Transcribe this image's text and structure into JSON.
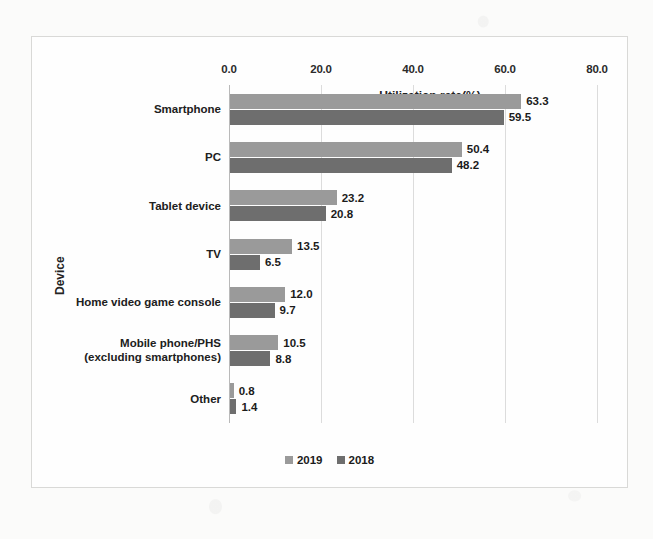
{
  "chart_data": {
    "type": "bar",
    "orientation": "horizontal",
    "title": "",
    "xlabel": "Utilization rate(%)",
    "ylabel": "Device",
    "xlim": [
      0.0,
      80.0
    ],
    "xticks": [
      "0.0",
      "20.0",
      "40.0",
      "60.0",
      "80.0"
    ],
    "xtick_values": [
      0,
      20,
      40,
      60,
      80
    ],
    "grid": true,
    "legend_position": "bottom",
    "categories": [
      "Smartphone",
      "PC",
      "Tablet device",
      "TV",
      "Home video game console",
      "Mobile phone/PHS\n(excluding smartphones)",
      "Other"
    ],
    "series": [
      {
        "name": "2019",
        "color": "#9a9a9a",
        "values": [
          63.3,
          50.4,
          23.2,
          13.5,
          12.0,
          10.5,
          0.8
        ],
        "labels": [
          "63.3",
          "50.4",
          "23.2",
          "13.5",
          "12.0",
          "10.5",
          "0.8"
        ]
      },
      {
        "name": "2018",
        "color": "#6e6e6e",
        "values": [
          59.5,
          48.2,
          20.8,
          6.5,
          9.7,
          8.8,
          1.4
        ],
        "labels": [
          "59.5",
          "48.2",
          "20.8",
          "6.5",
          "9.7",
          "8.8",
          "1.4"
        ]
      }
    ]
  },
  "category_labels": [
    {
      "line1": "Smartphone",
      "line2": ""
    },
    {
      "line1": "PC",
      "line2": ""
    },
    {
      "line1": "Tablet device",
      "line2": ""
    },
    {
      "line1": "TV",
      "line2": ""
    },
    {
      "line1": "Home video game console",
      "line2": ""
    },
    {
      "line1": "Mobile phone/PHS",
      "line2": "(excluding smartphones)"
    },
    {
      "line1": "Other",
      "line2": ""
    }
  ],
  "legend": [
    {
      "label": "2019",
      "color": "#9a9a9a"
    },
    {
      "label": "2018",
      "color": "#6e6e6e"
    }
  ]
}
